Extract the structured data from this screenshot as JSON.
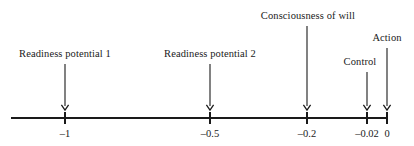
{
  "figure": {
    "type": "timeline",
    "background_color": "#ffffff",
    "ink_color": "#1a1a1a",
    "width": 414,
    "height": 146
  },
  "chart_data": {
    "type": "timeline",
    "title": "",
    "xlabel": "",
    "ylabel": "",
    "axis": {
      "orientation": "horizontal",
      "line_y": 118,
      "x_start_px": 11,
      "x_end_px": 388,
      "grid": false,
      "value_min": -1.0,
      "value_max": 0.0
    },
    "ticks": [
      {
        "label": "–1",
        "value": -1,
        "x_px": 65
      },
      {
        "label": "–0.5",
        "value": -0.5,
        "x_px": 210
      },
      {
        "label": "–0.2",
        "value": -0.2,
        "x_px": 307
      },
      {
        "label": "–0.02",
        "value": -0.02,
        "x_px": 367
      },
      {
        "label": "0",
        "value": 0,
        "x_px": 387
      }
    ],
    "events": [
      {
        "name": "readiness-potential-1",
        "label": "Readiness potential 1",
        "value": -1,
        "x_px": 65,
        "label_x_px": 65,
        "label_y_px": 48,
        "arrow_top_px": 64,
        "arrow_bottom_px": 110
      },
      {
        "name": "readiness-potential-2",
        "label": "Readiness potential 2",
        "value": -0.5,
        "x_px": 210,
        "label_x_px": 210,
        "label_y_px": 48,
        "arrow_top_px": 64,
        "arrow_bottom_px": 110
      },
      {
        "name": "consciousness-of-will",
        "label": "Consciousness of will",
        "value": -0.2,
        "x_px": 307,
        "label_x_px": 308,
        "label_y_px": 10,
        "arrow_top_px": 26,
        "arrow_bottom_px": 110
      },
      {
        "name": "control",
        "label": "Control",
        "value": -0.02,
        "x_px": 367,
        "label_x_px": 360,
        "label_y_px": 56,
        "arrow_top_px": 72,
        "arrow_bottom_px": 110
      },
      {
        "name": "action",
        "label": "Action",
        "value": 0,
        "x_px": 387,
        "label_x_px": 387,
        "label_y_px": 32,
        "arrow_top_px": 48,
        "arrow_bottom_px": 110
      }
    ]
  }
}
